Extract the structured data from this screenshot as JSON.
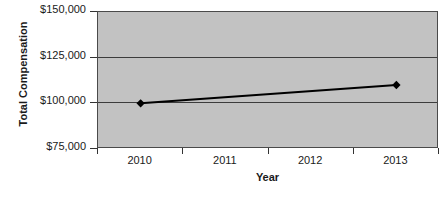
{
  "chart_data": {
    "type": "line",
    "title": "",
    "xlabel": "Year",
    "ylabel": "Total Compensation",
    "categories": [
      "2010",
      "2011",
      "2012",
      "2013"
    ],
    "series": [
      {
        "name": "Total Compensation",
        "points": [
          {
            "x": "2010",
            "y": 100000
          },
          {
            "x": "2013",
            "y": 110000
          }
        ],
        "values": [
          100000,
          null,
          null,
          110000
        ],
        "marker": "diamond",
        "marker_color": "#000000",
        "line_color": "#000000"
      }
    ],
    "ylim": [
      75000,
      150000
    ],
    "ytick_labels": [
      "$150,000",
      "$125,000",
      "$100,000",
      "$75,000"
    ],
    "ytick_values": [
      150000,
      125000,
      100000,
      75000
    ],
    "grid": true,
    "gridline_values": [
      125000,
      100000
    ],
    "legend": false,
    "plot_background": "#c2c2c2",
    "axis_color": "#333333"
  },
  "axes": {
    "y_title": "Total Compensation",
    "x_title": "Year"
  },
  "artifact": {
    "bottom_text": ""
  }
}
